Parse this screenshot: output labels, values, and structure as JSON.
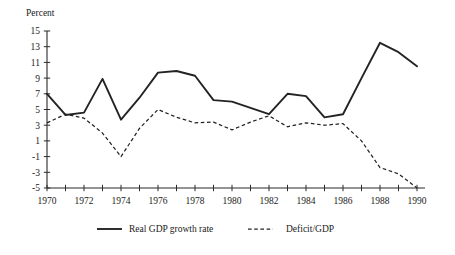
{
  "chart_data": {
    "type": "line",
    "title": "",
    "subtitle": "",
    "xlabel": "",
    "ylabel": "Percent",
    "xlim": [
      1970,
      1990
    ],
    "ylim": [
      -5,
      15
    ],
    "ytick_step": 2,
    "xtick_step": 1,
    "xlabel_step": 2,
    "grid": false,
    "legend_position": "bottom",
    "x": [
      1970,
      1971,
      1972,
      1973,
      1974,
      1975,
      1976,
      1977,
      1978,
      1979,
      1980,
      1981,
      1982,
      1983,
      1984,
      1985,
      1986,
      1987,
      1988,
      1989,
      1990
    ],
    "ytick_labels": [
      "15",
      "13",
      "11",
      "9",
      "7",
      "5",
      "3",
      "1",
      "-1",
      "-3",
      "-5"
    ],
    "ytick_values": [
      15,
      13,
      11,
      9,
      7,
      5,
      3,
      1,
      -1,
      -3,
      -5
    ],
    "xtick_labels": [
      "1970",
      "1972",
      "1974",
      "1976",
      "1978",
      "1980",
      "1982",
      "1984",
      "1986",
      "1988",
      "1990"
    ],
    "xtick_values": [
      1970,
      1972,
      1974,
      1976,
      1978,
      1980,
      1982,
      1984,
      1986,
      1988,
      1990
    ],
    "series": [
      {
        "name": "Real GDP growth rate",
        "style": "solid",
        "color": "#232323",
        "values": [
          7.0,
          4.3,
          4.6,
          8.9,
          3.7,
          6.5,
          9.7,
          9.9,
          9.3,
          6.2,
          6.0,
          5.2,
          4.4,
          7.0,
          6.7,
          4.0,
          4.4,
          9.0,
          13.5,
          12.3,
          10.5
        ]
      },
      {
        "name": "Deficit/GDP",
        "style": "dashed",
        "color": "#232323",
        "values": [
          3.3,
          4.4,
          3.9,
          2.0,
          -1.0,
          2.6,
          5.0,
          4.0,
          3.3,
          3.4,
          2.4,
          3.4,
          4.2,
          2.8,
          3.3,
          3.0,
          3.2,
          1.0,
          -2.4,
          -3.2,
          -5.0
        ]
      }
    ]
  },
  "legend": {
    "items": [
      {
        "label": "Real GDP growth rate",
        "style": "solid"
      },
      {
        "label": "Deficit/GDP",
        "style": "dashed"
      }
    ]
  }
}
